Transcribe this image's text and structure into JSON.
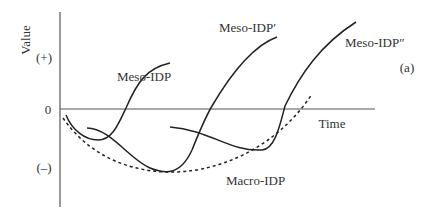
{
  "diagram": {
    "panel_label": "(a)",
    "y_axis": {
      "label": "Value",
      "ticks": [
        "(+)",
        "0",
        "(–)"
      ]
    },
    "x_axis": {
      "label": "Time"
    },
    "curves": [
      {
        "name": "Meso-IDP",
        "style": "solid"
      },
      {
        "name": "Meso-IDP′",
        "style": "solid"
      },
      {
        "name": "Meso-IDP″",
        "style": "solid"
      },
      {
        "name": "Macro-IDP",
        "style": "dashed"
      }
    ]
  }
}
